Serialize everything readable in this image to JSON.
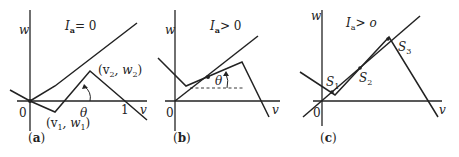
{
  "panels": [
    {
      "id": "a",
      "caption": "(a)",
      "caption_letter": "a",
      "title_var": "I",
      "title_sub": "a",
      "title_rel": "= 0",
      "axis_y_label": "w",
      "axis_x_label": "v",
      "origin_label": "0",
      "tick_label": "1",
      "point1_label": "(v",
      "point1_sub": "1",
      "point1_mid": ", w",
      "point1_sub2": "1",
      "point1_end": ")",
      "point2_label": "(v",
      "point2_sub": "2",
      "point2_mid": ", w",
      "point2_sub2": "2",
      "point2_end": ")",
      "angle_label": "θ"
    },
    {
      "id": "b",
      "caption": "(b)",
      "caption_letter": "b",
      "title_var": "I",
      "title_sub": "a",
      "title_rel": "> 0",
      "axis_y_label": "w",
      "axis_x_label": "v",
      "origin_label": "0",
      "angle_label": "θ"
    },
    {
      "id": "c",
      "caption": "(c)",
      "caption_letter": "c",
      "title_var": "I",
      "title_sub": "a",
      "title_rel": "> o",
      "axis_y_label": "w",
      "axis_x_label": "v",
      "origin_label": "0",
      "s1": "S",
      "s1_sub": "1",
      "s2": "S",
      "s2_sub": "2",
      "s3": "S",
      "s3_sub": "3"
    }
  ]
}
